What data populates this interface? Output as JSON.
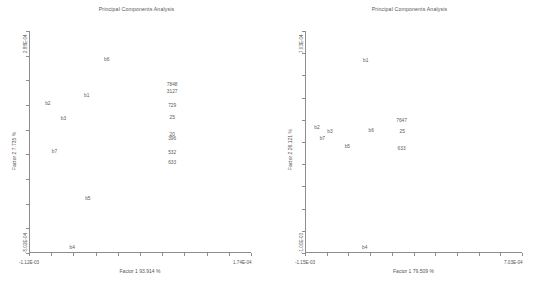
{
  "figure": {
    "width": 546,
    "height": 287,
    "background": "#ffffff",
    "ink_color": "#555555"
  },
  "chart_data": [
    {
      "type": "scatter",
      "panel": "left",
      "title": "Principal Components Analysis",
      "xlabel": "Factor 1  93.914 %",
      "ylabel": "Factor 2  7.735 %",
      "xlim": [
        -0.00112,
        0.000174
      ],
      "ylim": [
        -0.000502,
        0.000288
      ],
      "xtick_labels": [
        "-1.12E-03",
        "1.74E-04"
      ],
      "ytick_labels": [
        "-5.02E-04",
        "2.88E-04"
      ],
      "x_ticks": 10,
      "y_ticks": 9,
      "grid": false,
      "legend": "none",
      "points": [
        {
          "label": "b6",
          "x": 0.35,
          "y": 0.87
        },
        {
          "label": "7848",
          "x": 0.645,
          "y": 0.755
        },
        {
          "label": "3127",
          "x": 0.645,
          "y": 0.727
        },
        {
          "label": "b1",
          "x": 0.26,
          "y": 0.705
        },
        {
          "label": "b2",
          "x": 0.085,
          "y": 0.672
        },
        {
          "label": "729",
          "x": 0.645,
          "y": 0.664
        },
        {
          "label": "b3",
          "x": 0.155,
          "y": 0.605
        },
        {
          "label": "25",
          "x": 0.645,
          "y": 0.607
        },
        {
          "label": "20",
          "x": 0.645,
          "y": 0.53
        },
        {
          "label": "396",
          "x": 0.645,
          "y": 0.513
        },
        {
          "label": "b7",
          "x": 0.115,
          "y": 0.455
        },
        {
          "label": "532",
          "x": 0.645,
          "y": 0.452
        },
        {
          "label": "633",
          "x": 0.645,
          "y": 0.404
        },
        {
          "label": "b5",
          "x": 0.265,
          "y": 0.245
        },
        {
          "label": "b4",
          "x": 0.195,
          "y": 0.022
        }
      ]
    },
    {
      "type": "scatter",
      "panel": "right",
      "title": "Principal Components Analysis",
      "xlabel": "Factor 1  79.509 %",
      "ylabel": "Factor 2  26.121 %",
      "xlim": [
        -0.00115,
        0.000703
      ],
      "ylim": [
        -0.001,
        0.000703
      ],
      "xtick_labels": [
        "-1.15E-03",
        "7.03E-04"
      ],
      "ytick_labels": [
        "-1.00E-03",
        "7.03E-04"
      ],
      "x_ticks": 10,
      "y_ticks": 10,
      "grid": false,
      "legend": "none",
      "points": [
        {
          "label": "b1",
          "x": 0.28,
          "y": 0.865
        },
        {
          "label": "7647",
          "x": 0.445,
          "y": 0.595
        },
        {
          "label": "b2",
          "x": 0.055,
          "y": 0.565
        },
        {
          "label": "b3",
          "x": 0.115,
          "y": 0.545
        },
        {
          "label": "b6",
          "x": 0.305,
          "y": 0.548
        },
        {
          "label": "25",
          "x": 0.448,
          "y": 0.545
        },
        {
          "label": "b7",
          "x": 0.08,
          "y": 0.515
        },
        {
          "label": "b5",
          "x": 0.195,
          "y": 0.478
        },
        {
          "label": "633",
          "x": 0.445,
          "y": 0.47
        },
        {
          "label": "b4",
          "x": 0.275,
          "y": 0.022
        }
      ]
    }
  ]
}
